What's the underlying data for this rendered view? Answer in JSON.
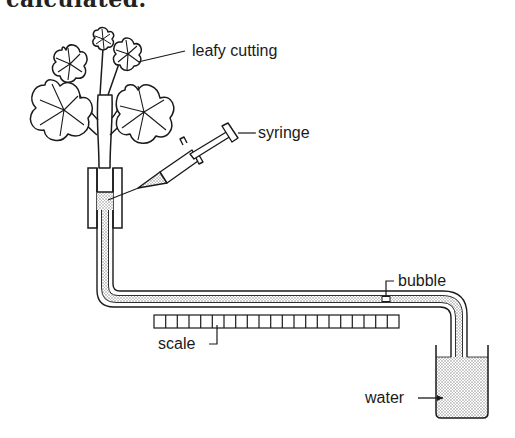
{
  "header": {
    "cut_text": "calculated."
  },
  "diagram": {
    "labels": {
      "leafy_cutting": "leafy cutting",
      "syringe": "syringe",
      "bubble": "bubble",
      "scale": "scale",
      "water": "water"
    },
    "scale_divisions": 21,
    "colors": {
      "ink": "#1a1a1a",
      "paper": "#ffffff",
      "stipple": "#9a9a9a"
    }
  }
}
